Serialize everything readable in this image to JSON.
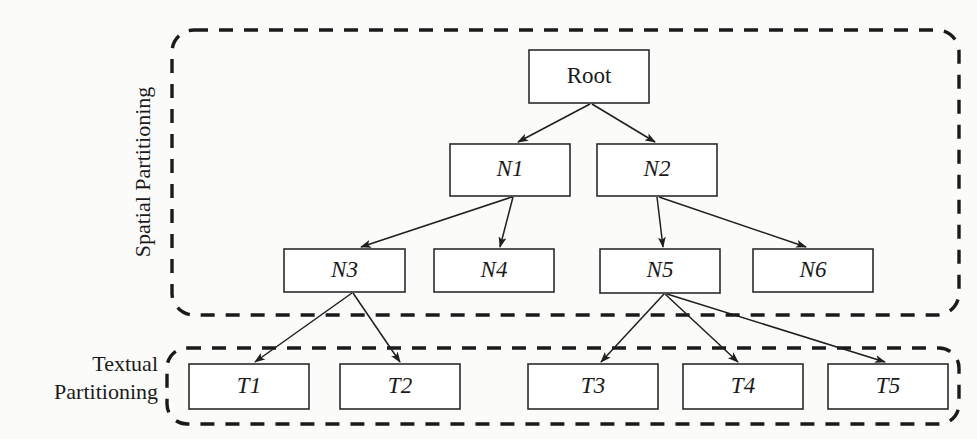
{
  "figure": {
    "type": "tree-diagram",
    "background_color": "#fbfbfa",
    "line_color": "#1f1f1f",
    "box_fill": "#ffffff"
  },
  "groups": [
    {
      "id": "spatial",
      "label": "Spatial Partitioning",
      "orientation": "vertical-left",
      "border_style": "dashed-rounded",
      "rect": {
        "x": 172,
        "y": 30,
        "w": 787,
        "h": 285,
        "r": 22
      },
      "label_pos": {
        "x": 150,
        "y": 172
      }
    },
    {
      "id": "textual",
      "label_line1": "Textual",
      "label_line2": "Partitioning",
      "orientation": "horizontal-left",
      "border_style": "dashed-rounded",
      "rect": {
        "x": 167,
        "y": 348,
        "w": 792,
        "h": 76,
        "r": 20
      },
      "label_pos": {
        "x": 158,
        "y": 371
      }
    }
  ],
  "nodes": [
    {
      "id": "root",
      "label": "Root",
      "italic": false,
      "x": 529,
      "y": 50,
      "w": 120,
      "h": 53,
      "level": 0
    },
    {
      "id": "n1",
      "label": "N1",
      "italic": true,
      "x": 450,
      "y": 144,
      "w": 120,
      "h": 52,
      "level": 1
    },
    {
      "id": "n2",
      "label": "N2",
      "italic": true,
      "x": 597,
      "y": 144,
      "w": 120,
      "h": 52,
      "level": 1
    },
    {
      "id": "n3",
      "label": "N3",
      "italic": true,
      "x": 284,
      "y": 249,
      "w": 121,
      "h": 43,
      "level": 2
    },
    {
      "id": "n4",
      "label": "N4",
      "italic": true,
      "x": 434,
      "y": 249,
      "w": 120,
      "h": 43,
      "level": 2
    },
    {
      "id": "n5",
      "label": "N5",
      "italic": true,
      "x": 600,
      "y": 249,
      "w": 120,
      "h": 44,
      "level": 2
    },
    {
      "id": "n6",
      "label": "N6",
      "italic": true,
      "x": 753,
      "y": 249,
      "w": 120,
      "h": 43,
      "level": 2
    },
    {
      "id": "t1",
      "label": "T1",
      "italic": true,
      "x": 189,
      "y": 364,
      "w": 120,
      "h": 45,
      "level": 3
    },
    {
      "id": "t2",
      "label": "T2",
      "italic": true,
      "x": 340,
      "y": 364,
      "w": 120,
      "h": 45,
      "level": 3
    },
    {
      "id": "t3",
      "label": "T3",
      "italic": true,
      "x": 528,
      "y": 364,
      "w": 130,
      "h": 45,
      "level": 3
    },
    {
      "id": "t4",
      "label": "T4",
      "italic": true,
      "x": 683,
      "y": 364,
      "w": 120,
      "h": 45,
      "level": 3
    },
    {
      "id": "t5",
      "label": "T5",
      "italic": true,
      "x": 828,
      "y": 364,
      "w": 120,
      "h": 45,
      "level": 3
    }
  ],
  "edges": [
    {
      "from": "root",
      "to": "n1",
      "x1": 590,
      "y1": 104,
      "x2": 518,
      "y2": 142
    },
    {
      "from": "root",
      "to": "n2",
      "x1": 592,
      "y1": 104,
      "x2": 655,
      "y2": 142
    },
    {
      "from": "n1",
      "to": "n3",
      "x1": 512,
      "y1": 197,
      "x2": 361,
      "y2": 247
    },
    {
      "from": "n1",
      "to": "n4",
      "x1": 513,
      "y1": 197,
      "x2": 500,
      "y2": 247
    },
    {
      "from": "n2",
      "to": "n5",
      "x1": 657,
      "y1": 197,
      "x2": 663,
      "y2": 247
    },
    {
      "from": "n2",
      "to": "n6",
      "x1": 659,
      "y1": 197,
      "x2": 806,
      "y2": 247
    },
    {
      "from": "n3",
      "to": "t1",
      "x1": 352,
      "y1": 293,
      "x2": 255,
      "y2": 362
    },
    {
      "from": "n3",
      "to": "t2",
      "x1": 353,
      "y1": 293,
      "x2": 400,
      "y2": 362
    },
    {
      "from": "n5",
      "to": "t3",
      "x1": 664,
      "y1": 294,
      "x2": 601,
      "y2": 362
    },
    {
      "from": "n5",
      "to": "t4",
      "x1": 665,
      "y1": 294,
      "x2": 738,
      "y2": 362
    },
    {
      "from": "n5",
      "to": "t5",
      "x1": 667,
      "y1": 294,
      "x2": 885,
      "y2": 362
    }
  ]
}
